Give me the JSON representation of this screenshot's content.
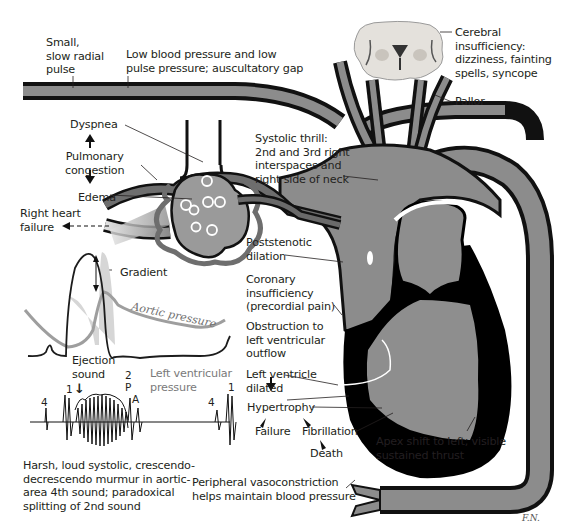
{
  "colors": {
    "vessel_fill": "#8c8c8c",
    "vessel_outline": "#111111",
    "myocardium": "#000000",
    "chamber": "#8e8e8e",
    "lung": "#9a9a9a",
    "pressure_curve": "#9e9e9e",
    "gradient_fill": "#d6d6d6",
    "text": "#231f20"
  },
  "labels": {
    "radial_pulse": "Small,\nslow radial\npulse",
    "low_bp": "Low blood pressure and low\npulse pressure; auscultatory gap",
    "cerebral": "Cerebral\ninsufficiency:\ndizziness, fainting\nspells, syncope",
    "pallor": "Pallor",
    "dyspnea": "Dyspnea",
    "pulmonary_congestion": "Pulmonary\ncongestion",
    "edema": "Edema",
    "right_heart_failure": "Right heart\nfailure",
    "systolic_thrill": "Systolic thrill:\n2nd and 3rd right\ninterspaces and\nright side of neck",
    "poststenotic": "Poststenotic\ndilation",
    "coronary": "Coronary\ninsufficiency\n(precordial pain)",
    "obstruction": "Obstruction to\nleft ventricular\noutflow",
    "lv_dilated": "Left ventricle\ndilated",
    "hypertrophy": "Hypertrophy",
    "failure": "Failure",
    "fibrillation": "Fibrillation",
    "death": "Death",
    "apex_shift": "Apex shift to left; visible\nsustained thrust",
    "peripheral": "Peripheral vasoconstriction\nhelps maintain blood pressure",
    "murmur": "Harsh, loud systolic, crescendo-\ndecrescendo murmur in aortic-\narea 4th sound; paradoxical\nsplitting of 2nd sound"
  },
  "pressure_tracing": {
    "gradient": "Gradient",
    "aortic_pressure": "Aortic pressure",
    "ejection_sound": "Ejection\nsound",
    "lv_pressure": "Left ventricular\npressure"
  },
  "phonocardiogram": {
    "markers": [
      {
        "id": "s4_a",
        "text": "4"
      },
      {
        "id": "s1_a",
        "text": "1"
      },
      {
        "id": "s2",
        "text": "2"
      },
      {
        "id": "p",
        "text": "P"
      },
      {
        "id": "a",
        "text": "A"
      },
      {
        "id": "s4_b",
        "text": "4"
      },
      {
        "id": "s1_b",
        "text": "1"
      }
    ]
  },
  "signature": "F.N."
}
